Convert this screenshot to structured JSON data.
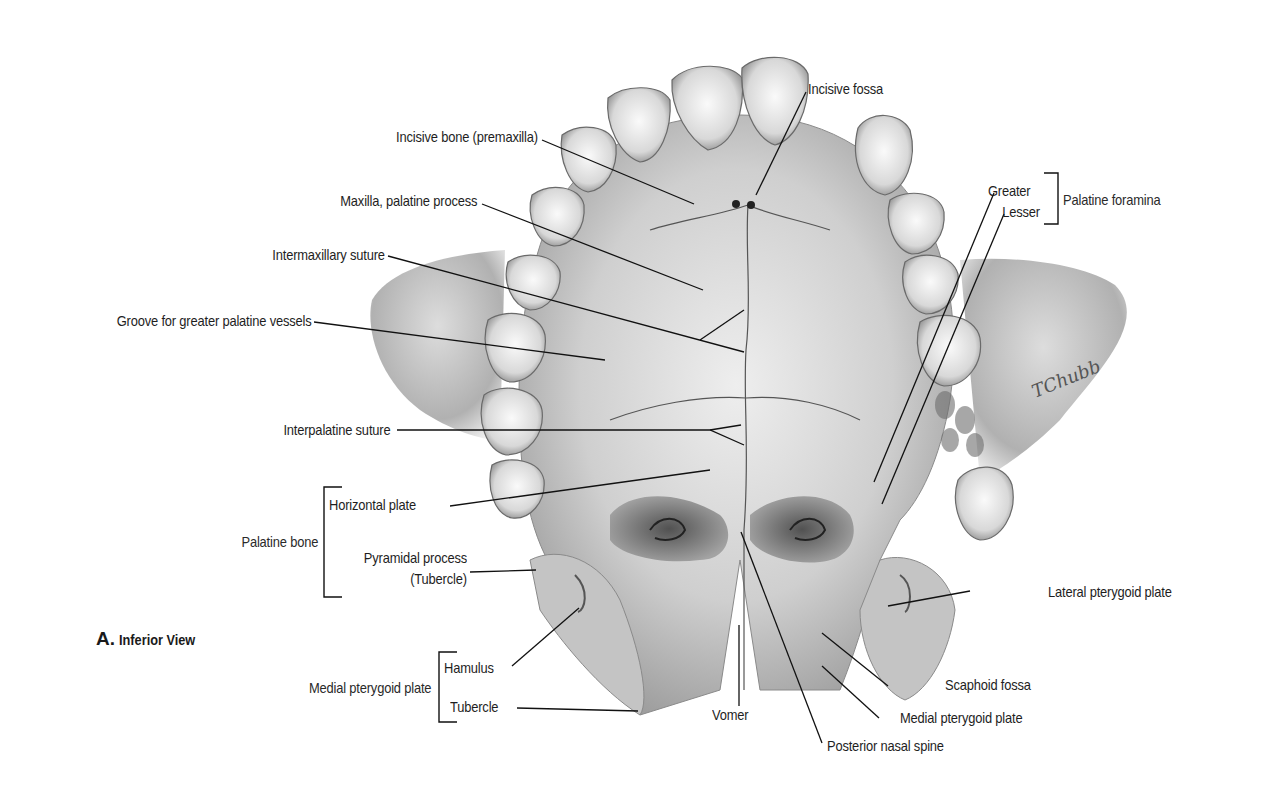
{
  "figure": {
    "panel_letter": "A.",
    "panel_title": "Inferior View",
    "artist_signature": "TChubb"
  },
  "labels": {
    "incisive_fossa": "Incisive fossa",
    "incisive_bone": "Incisive bone (premaxilla)",
    "maxilla_palatine_process": "Maxilla, palatine process",
    "intermaxillary_suture": "Intermaxillary suture",
    "groove_greater_palatine": "Groove for greater palatine vessels",
    "interpalatine_suture": "Interpalatine suture",
    "palatine_foramina": {
      "group": "Palatine foramina",
      "greater": "Greater",
      "lesser": "Lesser"
    },
    "palatine_bone": {
      "group": "Palatine bone",
      "horizontal_plate": "Horizontal plate",
      "pyramidal_process_line1": "Pyramidal process",
      "pyramidal_process_line2": "(Tubercle)"
    },
    "medial_pterygoid_plate_left": {
      "group": "Medial pterygoid plate",
      "hamulus": "Hamulus",
      "tubercle": "Tubercle"
    },
    "lateral_pterygoid_plate": "Lateral pterygoid plate",
    "scaphoid_fossa": "Scaphoid fossa",
    "medial_pterygoid_plate_right": "Medial pterygoid plate",
    "vomer": "Vomer",
    "posterior_nasal_spine": "Posterior nasal spine"
  },
  "colors": {
    "text": "#1e1e1e",
    "leader": "#111111",
    "bone_light": "#e6e6e6",
    "bone_mid": "#bdbdbd",
    "bone_dark": "#7a7a7a"
  }
}
